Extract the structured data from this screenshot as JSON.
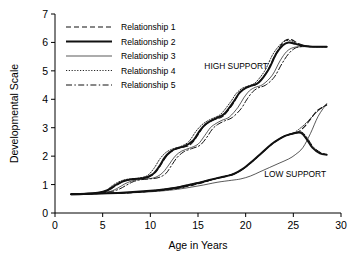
{
  "chart_data": {
    "type": "line",
    "title": "",
    "xlabel": "Age in Years",
    "ylabel": "Developmental Scale",
    "xlim": [
      0,
      30
    ],
    "ylim": [
      0,
      7
    ],
    "xticks": [
      0,
      5,
      10,
      15,
      20,
      25,
      30
    ],
    "yticks": [
      0,
      1,
      2,
      3,
      4,
      5,
      6,
      7
    ],
    "grid": false,
    "legend_position": "top-left-inside",
    "annotations": [
      {
        "text": "HIGH SUPPORT",
        "x": 19.0,
        "y": 5.05
      },
      {
        "text": "LOW SUPPORT",
        "x": 25.2,
        "y": 1.28
      }
    ],
    "legend": [
      {
        "name": "Relationship 1",
        "dash": "5,3",
        "width": 1.1
      },
      {
        "name": "Relationship 2",
        "dash": "none",
        "width": 2.0
      },
      {
        "name": "Relationship 3",
        "dash": "none",
        "width": 0.7
      },
      {
        "name": "Relationship 4",
        "dash": "1.2,1.6",
        "width": 0.9
      },
      {
        "name": "Relationship 5",
        "dash": "6,2.4,1.4,2.4",
        "width": 1.0
      }
    ],
    "groups": [
      {
        "group": "HIGH SUPPORT",
        "series": [
          {
            "name": "Relationship 1",
            "x": [
              1.7,
              3,
              4.5,
              5.5,
              6.2,
              6.8,
              7.4,
              8,
              8.8,
              9.8,
              10.6,
              11.2,
              11.8,
              12.4,
              13.2,
              14.2,
              15.0,
              15.6,
              16.2,
              16.8,
              17.6,
              18.6,
              19.2,
              19.8,
              20.4,
              21.2,
              22.2,
              23.0,
              23.6,
              24.2,
              24.8,
              25.6,
              26.6,
              27.6,
              28.5
            ],
            "y": [
              0.66,
              0.67,
              0.7,
              0.78,
              0.92,
              1.05,
              1.14,
              1.19,
              1.21,
              1.26,
              1.45,
              1.75,
              2.05,
              2.2,
              2.3,
              2.4,
              2.75,
              3.05,
              3.2,
              3.3,
              3.4,
              3.8,
              4.15,
              4.35,
              4.45,
              4.55,
              4.95,
              5.5,
              5.85,
              6.08,
              6.1,
              5.95,
              5.86,
              5.85,
              5.85
            ]
          },
          {
            "name": "Relationship 2",
            "x": [
              1.7,
              3,
              4.5,
              5.5,
              6.2,
              6.9,
              7.6,
              8.3,
              9.2,
              10.2,
              10.9,
              11.5,
              12.1,
              12.8,
              13.6,
              14.5,
              15.2,
              15.8,
              16.4,
              17.0,
              17.8,
              18.8,
              19.4,
              20.0,
              20.6,
              21.4,
              22.4,
              23.2,
              23.9,
              24.5,
              25.2,
              26.0,
              27.0,
              28.0,
              28.5
            ],
            "y": [
              0.66,
              0.67,
              0.71,
              0.8,
              0.95,
              1.08,
              1.16,
              1.2,
              1.22,
              1.35,
              1.62,
              1.95,
              2.15,
              2.28,
              2.35,
              2.55,
              2.9,
              3.12,
              3.25,
              3.35,
              3.5,
              3.95,
              4.25,
              4.4,
              4.48,
              4.6,
              5.05,
              5.6,
              5.9,
              6.0,
              5.95,
              5.88,
              5.85,
              5.85,
              5.85
            ]
          },
          {
            "name": "Relationship 3",
            "x": [
              1.7,
              3,
              4.6,
              5.8,
              6.6,
              7.3,
              8.0,
              8.8,
              9.6,
              10.5,
              11.3,
              12.0,
              12.6,
              13.3,
              14.1,
              15.0,
              15.7,
              16.3,
              16.9,
              17.5,
              18.3,
              19.2,
              19.8,
              20.4,
              21.0,
              21.8,
              22.8,
              23.6,
              24.3,
              25.0,
              25.8,
              26.6,
              27.5,
              28.5
            ],
            "y": [
              0.66,
              0.67,
              0.7,
              0.76,
              0.88,
              1.02,
              1.12,
              1.18,
              1.2,
              1.25,
              1.42,
              1.72,
              2.0,
              2.18,
              2.28,
              2.42,
              2.72,
              3.0,
              3.15,
              3.26,
              3.38,
              3.72,
              4.05,
              4.3,
              4.42,
              4.52,
              4.85,
              5.35,
              5.68,
              5.82,
              5.85,
              5.85,
              5.85,
              5.85
            ]
          },
          {
            "name": "Relationship 4",
            "x": [
              1.7,
              3,
              4.5,
              5.4,
              6.0,
              6.6,
              7.2,
              7.9,
              8.7,
              9.7,
              10.4,
              11.0,
              11.6,
              12.3,
              13.1,
              14.0,
              14.8,
              15.4,
              16.0,
              16.6,
              17.4,
              18.4,
              19.0,
              19.6,
              20.2,
              21.0,
              22.0,
              22.8,
              23.5,
              24.1,
              24.8,
              25.6,
              26.6,
              27.6,
              28.5
            ],
            "y": [
              0.66,
              0.67,
              0.71,
              0.8,
              0.96,
              1.08,
              1.16,
              1.2,
              1.22,
              1.32,
              1.58,
              1.9,
              2.12,
              2.25,
              2.33,
              2.5,
              2.88,
              3.1,
              3.24,
              3.34,
              3.48,
              3.9,
              4.2,
              4.38,
              4.46,
              4.58,
              5.0,
              5.55,
              5.88,
              6.05,
              6.05,
              5.92,
              5.86,
              5.85,
              5.85
            ]
          },
          {
            "name": "Relationship 5",
            "x": [
              1.7,
              3,
              4.7,
              5.9,
              6.8,
              7.5,
              8.2,
              9.0,
              9.9,
              10.8,
              11.6,
              12.2,
              12.8,
              13.5,
              14.3,
              15.2,
              15.9,
              16.5,
              17.1,
              17.8,
              18.6,
              19.5,
              20.1,
              20.7,
              21.3,
              22.1,
              23.0,
              23.8,
              24.5,
              25.2,
              26.0,
              26.8,
              27.7,
              28.5
            ],
            "y": [
              0.66,
              0.67,
              0.7,
              0.75,
              0.85,
              0.98,
              1.1,
              1.17,
              1.2,
              1.24,
              1.38,
              1.66,
              1.95,
              2.15,
              2.26,
              2.38,
              2.65,
              2.95,
              3.12,
              3.24,
              3.36,
              3.66,
              3.98,
              4.25,
              4.4,
              4.5,
              4.78,
              5.25,
              5.6,
              5.8,
              5.86,
              5.85,
              5.85,
              5.85
            ]
          }
        ]
      },
      {
        "group": "LOW SUPPORT",
        "series": [
          {
            "name": "Relationship 1",
            "x": [
              1.7,
              4,
              7,
              10,
              12.5,
              14.5,
              16.0,
              17.0,
              17.8,
              18.6,
              19.5,
              20.5,
              21.5,
              22.5,
              23.3,
              24.0,
              24.8,
              25.5,
              26.2,
              26.8,
              27.5,
              28.5
            ],
            "y": [
              0.66,
              0.68,
              0.7,
              0.76,
              0.85,
              0.98,
              1.12,
              1.22,
              1.28,
              1.35,
              1.5,
              1.75,
              2.05,
              2.35,
              2.55,
              2.7,
              2.78,
              2.85,
              3.05,
              3.3,
              3.6,
              3.8
            ]
          },
          {
            "name": "Relationship 2",
            "x": [
              1.7,
              4,
              7,
              10,
              12.5,
              14.5,
              16.2,
              17.2,
              18.0,
              18.8,
              19.7,
              20.7,
              21.7,
              22.7,
              23.5,
              24.2,
              25.0,
              25.8,
              26.4,
              27.0,
              27.8,
              28.5
            ],
            "y": [
              0.66,
              0.68,
              0.71,
              0.78,
              0.88,
              1.02,
              1.16,
              1.24,
              1.3,
              1.38,
              1.55,
              1.82,
              2.12,
              2.42,
              2.6,
              2.72,
              2.8,
              2.82,
              2.6,
              2.3,
              2.1,
              2.05
            ]
          },
          {
            "name": "Relationship 3",
            "x": [
              1.7,
              4,
              8,
              12,
              15,
              17,
              18.5,
              19.5,
              20.5,
              21.5,
              22.5,
              23.5,
              24.5,
              25.2,
              26.0,
              26.8,
              27.6,
              28.5
            ],
            "y": [
              0.66,
              0.68,
              0.71,
              0.8,
              0.95,
              1.08,
              1.15,
              1.2,
              1.3,
              1.45,
              1.6,
              1.75,
              1.9,
              2.05,
              2.3,
              2.8,
              3.4,
              3.85
            ]
          },
          {
            "name": "Relationship 4",
            "x": [
              1.7,
              4,
              7,
              10,
              12.5,
              14.5,
              16.1,
              17.1,
              17.9,
              18.7,
              19.6,
              20.6,
              21.6,
              22.6,
              23.4,
              24.1,
              24.9,
              25.6,
              26.3,
              27.0,
              27.8,
              28.5
            ],
            "y": [
              0.66,
              0.68,
              0.7,
              0.77,
              0.86,
              1.0,
              1.14,
              1.23,
              1.29,
              1.36,
              1.52,
              1.78,
              2.08,
              2.38,
              2.57,
              2.71,
              2.79,
              2.95,
              3.15,
              3.4,
              3.65,
              3.82
            ]
          },
          {
            "name": "Relationship 5",
            "x": [
              1.7,
              4,
              7,
              10,
              12.5,
              14.5,
              16.3,
              17.3,
              18.1,
              18.9,
              19.8,
              20.8,
              21.8,
              22.8,
              23.6,
              24.3,
              25.1,
              25.9,
              26.5,
              27.1,
              27.9,
              28.5
            ],
            "y": [
              0.66,
              0.68,
              0.71,
              0.78,
              0.89,
              1.03,
              1.17,
              1.25,
              1.31,
              1.4,
              1.57,
              1.84,
              2.14,
              2.44,
              2.62,
              2.74,
              2.82,
              2.84,
              2.62,
              2.32,
              2.12,
              2.06
            ]
          }
        ]
      }
    ]
  }
}
